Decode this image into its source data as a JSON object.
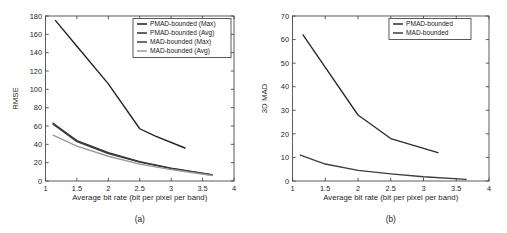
{
  "figure": {
    "panels": [
      {
        "caption": "(a)",
        "chart_data": {
          "type": "line",
          "title": "",
          "xlabel": "Average bit rate (bit per pixel per band)",
          "ylabel": "RMSE",
          "xlim": [
            1,
            4
          ],
          "ylim": [
            0,
            180
          ],
          "xticks": [
            1,
            1.5,
            2,
            2.5,
            3,
            3.5,
            4
          ],
          "xticklabels": [
            "1",
            "1.5",
            "2",
            "2.5",
            "3",
            "3.5",
            "4"
          ],
          "yticks": [
            0,
            20,
            40,
            60,
            80,
            100,
            120,
            140,
            160,
            180
          ],
          "yticklabels": [
            "0",
            "20",
            "40",
            "60",
            "80",
            "100",
            "120",
            "140",
            "160",
            "180"
          ],
          "grid": false,
          "legend_position": "upper right",
          "series": [
            {
              "name": "PMAD-bounded (Max)",
              "color": "#1f1f1f",
              "x": [
                1.16,
                1.5,
                2.0,
                2.5,
                2.75,
                3.22
              ],
              "y": [
                175,
                147,
                106,
                57,
                49,
                36
              ]
            },
            {
              "name": "PMAD-bounded (Avg)",
              "color": "#2e2e2e",
              "x": [
                1.12,
                1.5,
                2.0,
                2.5,
                3.0,
                3.65
              ],
              "y": [
                63,
                44,
                31,
                21,
                14,
                7
              ]
            },
            {
              "name": "MAD-bounded (Max)",
              "color": "#3d3d3d",
              "x": [
                1.12,
                1.5,
                2.0,
                2.5,
                3.0,
                3.65
              ],
              "y": [
                62,
                43,
                30,
                20.5,
                13.5,
                6.5
              ]
            },
            {
              "name": "MAD-bounded (Avg)",
              "color": "#9a9a9a",
              "x": [
                1.12,
                1.5,
                2.0,
                2.5,
                3.0,
                3.65
              ],
              "y": [
                50,
                38,
                27,
                18.5,
                12.5,
                6
              ]
            }
          ]
        }
      },
      {
        "caption": "(b)",
        "chart_data": {
          "type": "line",
          "title": "",
          "xlabel": "Average bit rate (bit per pixel per band)",
          "ylabel": "3D MAD",
          "xlim": [
            1,
            4
          ],
          "ylim": [
            0,
            70
          ],
          "xticks": [
            1,
            1.5,
            2,
            2.5,
            3,
            3.5,
            4
          ],
          "xticklabels": [
            "1",
            "1.5",
            "2",
            "2.5",
            "3",
            "3.5",
            "4"
          ],
          "yticks": [
            0,
            10,
            20,
            30,
            40,
            50,
            60,
            70
          ],
          "yticklabels": [
            "0",
            "10",
            "20",
            "30",
            "40",
            "50",
            "60",
            "70"
          ],
          "grid": false,
          "legend_position": "upper right",
          "series": [
            {
              "name": "PMAD-bounded",
              "color": "#2b2b2b",
              "x": [
                1.16,
                2.0,
                2.5,
                3.22
              ],
              "y": [
                62,
                28,
                18,
                12
              ]
            },
            {
              "name": "MAD-bounded",
              "color": "#3d3d3d",
              "x": [
                1.12,
                1.5,
                2.0,
                2.5,
                3.0,
                3.65
              ],
              "y": [
                11,
                7.2,
                4.5,
                3.0,
                1.8,
                0.7
              ]
            }
          ]
        }
      }
    ]
  }
}
